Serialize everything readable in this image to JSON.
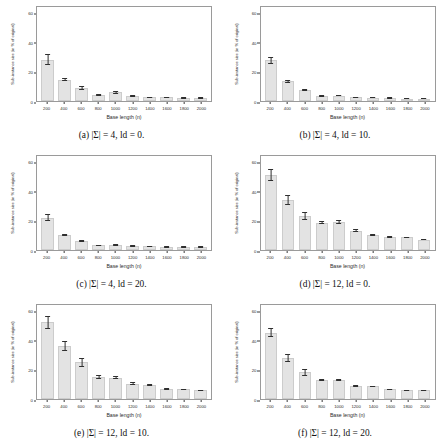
{
  "figure": {
    "axis": {
      "xlabel": "Base length (n)",
      "ylabel": "Sub-instance size (in % of original)",
      "yticks": [
        "0",
        "20",
        "40",
        "60"
      ],
      "ylim": [
        0,
        65
      ],
      "xticks": [
        "200",
        "400",
        "600",
        "800",
        "1000",
        "1200",
        "1400",
        "1600",
        "1800",
        "2000"
      ]
    },
    "panels": [
      {
        "id": "panel-a",
        "caption": "(a) |Σ| = 4, ld = 0.",
        "chart_data": {
          "type": "bar",
          "title": "(a) |Σ| = 4, ld = 0.",
          "xlabel": "Base length (n)",
          "ylabel": "Sub-instance size (in % of original)",
          "ylim": [
            0,
            65
          ],
          "grid": false,
          "legend": "none",
          "categories": [
            "200",
            "400",
            "600",
            "800",
            "1000",
            "1200",
            "1400",
            "1600",
            "1800",
            "2000"
          ],
          "values": [
            28.0,
            14.5,
            9.0,
            4.2,
            5.8,
            3.4,
            2.6,
            2.6,
            2.0,
            2.0
          ],
          "errors": [
            3.6,
            0.9,
            1.3,
            0.5,
            1.1,
            0.6,
            0.4,
            0.4,
            0.3,
            0.3
          ]
        }
      },
      {
        "id": "panel-b",
        "caption": "(b) |Σ| = 4, ld = 10.",
        "chart_data": {
          "type": "bar",
          "title": "(b) |Σ| = 4, ld = 10.",
          "xlabel": "Base length (n)",
          "ylabel": "Sub-instance size (in % of original)",
          "ylim": [
            0,
            65
          ],
          "grid": false,
          "legend": "none",
          "categories": [
            "200",
            "400",
            "600",
            "800",
            "1000",
            "1200",
            "1400",
            "1600",
            "1800",
            "2000"
          ],
          "values": [
            27.5,
            13.5,
            7.5,
            3.4,
            3.6,
            2.4,
            2.2,
            1.8,
            1.6,
            1.6
          ],
          "errors": [
            2.2,
            0.9,
            0.7,
            0.4,
            0.4,
            0.3,
            0.3,
            0.2,
            0.2,
            0.2
          ]
        }
      },
      {
        "id": "panel-c",
        "caption": "(c) |Σ| = 4, ld = 20.",
        "chart_data": {
          "type": "bar",
          "title": "(c) |Σ| = 4, ld = 20.",
          "xlabel": "Base length (n)",
          "ylabel": "Sub-instance size (in % of original)",
          "ylim": [
            0,
            65
          ],
          "grid": false,
          "legend": "none",
          "categories": [
            "200",
            "400",
            "600",
            "800",
            "1000",
            "1200",
            "1400",
            "1600",
            "1800",
            "2000"
          ],
          "values": [
            22.0,
            10.0,
            6.0,
            3.2,
            3.4,
            2.6,
            2.4,
            1.8,
            1.8,
            1.8
          ],
          "errors": [
            2.4,
            0.7,
            0.5,
            0.3,
            0.3,
            0.3,
            0.2,
            0.2,
            0.2,
            0.2
          ]
        }
      },
      {
        "id": "panel-d",
        "caption": "(d) |Σ| = 12, ld = 0.",
        "chart_data": {
          "type": "bar",
          "title": "(d) |Σ| = 12, ld = 0.",
          "xlabel": "Base length (n)",
          "ylabel": "Sub-instance size (in % of original)",
          "ylim": [
            0,
            65
          ],
          "grid": false,
          "legend": "none",
          "categories": [
            "200",
            "400",
            "600",
            "800",
            "1000",
            "1200",
            "1400",
            "1600",
            "1800",
            "2000"
          ],
          "values": [
            51.0,
            34.0,
            23.0,
            18.5,
            19.0,
            13.0,
            10.5,
            9.0,
            8.5,
            7.0
          ],
          "errors": [
            4.0,
            3.5,
            2.8,
            1.0,
            1.0,
            1.0,
            0.6,
            0.5,
            0.5,
            0.4
          ]
        }
      },
      {
        "id": "panel-e",
        "caption": "(e) |Σ| = 12, ld = 10.",
        "chart_data": {
          "type": "bar",
          "title": "(e) |Σ| = 12, ld = 10.",
          "xlabel": "Base length (n)",
          "ylabel": "Sub-instance size (in % of original)",
          "ylim": [
            0,
            65
          ],
          "grid": false,
          "legend": "none",
          "categories": [
            "200",
            "400",
            "600",
            "800",
            "1000",
            "1200",
            "1400",
            "1600",
            "1800",
            "2000"
          ],
          "values": [
            52.0,
            36.0,
            25.0,
            15.0,
            14.5,
            10.5,
            9.5,
            7.0,
            6.5,
            6.0
          ],
          "errors": [
            4.2,
            3.6,
            3.0,
            1.0,
            1.0,
            0.8,
            0.6,
            0.5,
            0.5,
            0.4
          ]
        }
      },
      {
        "id": "panel-f",
        "caption": "(f) |Σ| = 12, ld = 20.",
        "chart_data": {
          "type": "bar",
          "title": "(f) |Σ| = 12, ld = 20.",
          "xlabel": "Base length (n)",
          "ylabel": "Sub-instance size (in % of original)",
          "ylim": [
            0,
            65
          ],
          "grid": false,
          "legend": "none",
          "categories": [
            "200",
            "400",
            "600",
            "800",
            "1000",
            "1200",
            "1400",
            "1600",
            "1800",
            "2000"
          ],
          "values": [
            45.0,
            28.0,
            18.0,
            13.0,
            13.0,
            9.0,
            8.5,
            6.5,
            6.0,
            6.0
          ],
          "errors": [
            3.2,
            2.6,
            2.2,
            0.8,
            0.8,
            0.6,
            0.5,
            0.4,
            0.4,
            0.4
          ]
        }
      }
    ]
  }
}
